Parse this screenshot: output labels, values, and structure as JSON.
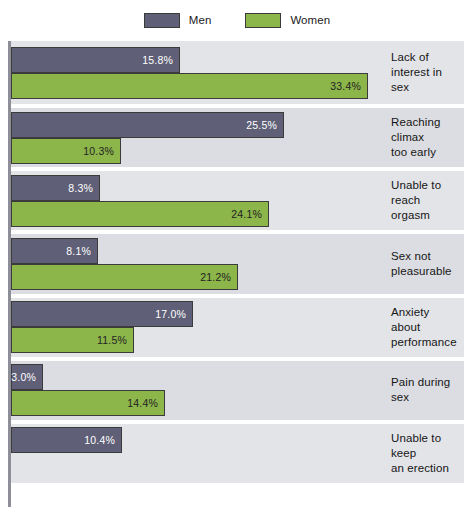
{
  "legend": {
    "entries": [
      {
        "label": "Men",
        "color": "#5f5f77"
      },
      {
        "label": "Women",
        "color": "#8cb54a"
      }
    ]
  },
  "chart_data": {
    "type": "bar",
    "orientation": "horizontal",
    "title": "",
    "subtitle": "",
    "xlabel": "",
    "ylabel": "",
    "xlim": [
      0,
      34.5
    ],
    "grid": false,
    "legend_position": "top-center",
    "value_suffix": "%",
    "categories": [
      "Lack of interest in sex",
      "Reaching climax too early",
      "Unable to reach orgasm",
      "Sex not pleasurable",
      "Anxiety about performance",
      "Pain during sex",
      "Unable to keep an erection"
    ],
    "series": [
      {
        "name": "Men",
        "color": "#5f5f77",
        "values": [
          15.8,
          25.5,
          8.3,
          8.1,
          17.0,
          3.0,
          10.4
        ],
        "labels": [
          "15.8%",
          "25.5%",
          "8.3%",
          "8.1%",
          "17.0%",
          "3.0%",
          "10.4%"
        ]
      },
      {
        "name": "Women",
        "color": "#8cb54a",
        "values": [
          33.4,
          10.3,
          24.1,
          21.2,
          11.5,
          14.4,
          null
        ],
        "labels": [
          "33.4%",
          "10.3%",
          "24.1%",
          "21.2%",
          "11.5%",
          "14.4%",
          null
        ]
      }
    ],
    "category_labels_lines": [
      [
        "Lack of",
        "interest in sex"
      ],
      [
        "Reaching climax",
        "too early"
      ],
      [
        "Unable to reach",
        "orgasm"
      ],
      [
        "Sex not",
        "pleasurable"
      ],
      [
        "Anxiety about",
        "performance"
      ],
      [
        "Pain during sex"
      ],
      [
        "Unable to keep",
        "an erection"
      ]
    ]
  }
}
